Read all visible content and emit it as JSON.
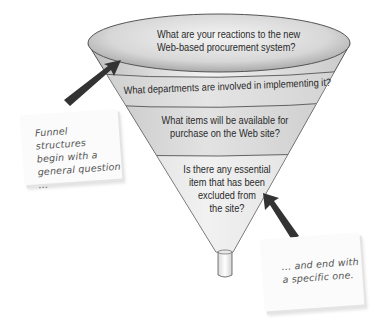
{
  "diagram": {
    "type": "funnel",
    "colors": {
      "funnel_light": "#f2f2f2",
      "funnel_mid": "#d6d6d6",
      "funnel_dark": "#a8a8a8",
      "outline": "#555555",
      "arrow": "#333333",
      "note_bg": "#fbfbfb",
      "note_text": "#555555"
    },
    "levels": [
      {
        "line1": "What are your reactions to the new",
        "line2": "Web-based procurement system?"
      },
      {
        "line1": "What departments are involved in implementing it?"
      },
      {
        "line1": "What items will be available for",
        "line2": "purchase on the Web site?"
      },
      {
        "line1": "Is there any essential",
        "line2": "item that has been",
        "line3": "excluded from",
        "line4": "the site?"
      }
    ],
    "notes": {
      "left": {
        "line1": "Funnel structures",
        "line2": "begin with a",
        "line3": "general question ..."
      },
      "right": {
        "line1": "... and end with",
        "line2": "a specific one."
      }
    }
  }
}
